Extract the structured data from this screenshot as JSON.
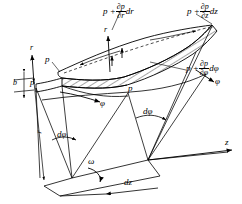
{
  "figure": {
    "background_color": "#ffffff",
    "line_color": "#000000"
  },
  "labels": {
    "p_top_left": "p",
    "p_left": "p",
    "p_center": "p",
    "b": "b",
    "r_left_arrow": "r",
    "r_mid_arrow": "r",
    "r_dimension": "r",
    "phi_left_arrow": "φ",
    "phi_right_arrow": "φ",
    "omega": "ω",
    "z_axis": "z",
    "dz": "dz",
    "dphi_left": "dφ",
    "dphi_right": "dφ"
  },
  "formulas": {
    "radial": {
      "lead": "p +",
      "numerator": "∂p",
      "denominator": "∂r",
      "differential": "dr"
    },
    "axial": {
      "lead": "p +",
      "numerator": "∂p",
      "denominator": "∂z",
      "differential": "dz"
    },
    "tangential": {
      "lead": "p +",
      "numerator": "∂p",
      "denominator": "∂φ",
      "differential": "dφ"
    }
  }
}
